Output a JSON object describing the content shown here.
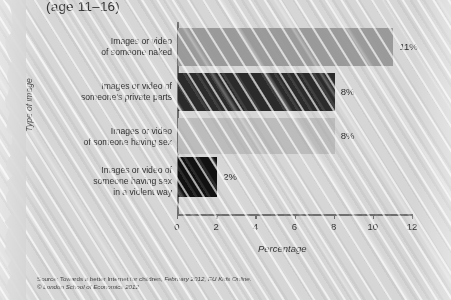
{
  "subtitle": "(age 11–16)",
  "axis": {
    "ylabel": "Type of image",
    "xlabel": "Percentage"
  },
  "source": {
    "line1_plain": "Source: Towards a better Internet for children, ",
    "line1_italic": "February 2012, EU Kids Online.",
    "line2": "© London School of Economics 2012"
  },
  "chart_data": {
    "type": "bar",
    "orientation": "horizontal",
    "title": "(age 11–16)",
    "xlabel": "Percentage",
    "ylabel": "Type of image",
    "xlim": [
      0,
      12
    ],
    "xticks": [
      0,
      2,
      4,
      6,
      8,
      10,
      12
    ],
    "grid": false,
    "legend": "none",
    "categories": [
      "Images or video\nof someone naked",
      "Images or video of\nsomeone's private parts",
      "Images or video\nof someone having sex",
      "Images or video of\nsomeone having sex\nin a violent way"
    ],
    "values": [
      11,
      8,
      8,
      2
    ],
    "data_labels": [
      "11%",
      "8%",
      "8%",
      "2%"
    ],
    "colors": [
      "#9a9a9a",
      "#2b2b2b",
      "#bcbcbc",
      "#111111"
    ],
    "bars": [
      {
        "label_line1": "Images or video",
        "label_line2": "of someone naked",
        "label_line3": "",
        "value": 11,
        "data_label": "11%",
        "color": "#9a9a9a"
      },
      {
        "label_line1": "Images or video of",
        "label_line2": "someone's private parts",
        "label_line3": "",
        "value": 8,
        "data_label": "8%",
        "color": "#2b2b2b"
      },
      {
        "label_line1": "Images or video",
        "label_line2": "of someone having sex",
        "label_line3": "",
        "value": 8,
        "data_label": "8%",
        "color": "#bcbcbc"
      },
      {
        "label_line1": "Images or video of",
        "label_line2": "someone having sex",
        "label_line3": "in a violent way",
        "value": 2,
        "data_label": "2%",
        "color": "#111111"
      }
    ]
  }
}
